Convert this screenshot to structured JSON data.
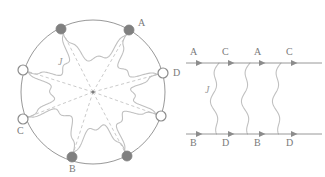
{
  "figure": {
    "background_color": "#ffffff",
    "stroke_color": "#8c8c8c",
    "wavy_color": "#c0c0c0",
    "dashed_color": "#bdbdbd",
    "filled_node_color": "#808080",
    "open_node_fill": "#ffffff",
    "label_color": "#7a7a7a"
  },
  "chart_data": {
    "type": "diagram",
    "title": "",
    "panels": [
      {
        "name": "circle-panel",
        "kind": "ring-diagram",
        "center": {
          "x": 93,
          "y": 92
        },
        "radius": 72,
        "node_count": 8,
        "center_point": true,
        "nodes": [
          {
            "id": "n0",
            "label": "A",
            "filled": true,
            "angle_deg": -60,
            "x": 129,
            "y": 30,
            "label_dx": 9,
            "label_dy": -4
          },
          {
            "id": "n1",
            "label": "D",
            "filled": false,
            "angle_deg": -15,
            "x": 163,
            "y": 73,
            "label_dx": 10,
            "label_dy": 3
          },
          {
            "id": "n2",
            "label": "",
            "filled": false,
            "angle_deg": 20,
            "x": 161,
            "y": 116,
            "label_dx": 0,
            "label_dy": 0
          },
          {
            "id": "n3",
            "label": "",
            "filled": true,
            "angle_deg": 62,
            "x": 127,
            "y": 156,
            "label_dx": 0,
            "label_dy": 0
          },
          {
            "id": "n4",
            "label": "B",
            "filled": true,
            "angle_deg": 108,
            "x": 72,
            "y": 157,
            "label_dx": -3,
            "label_dy": 15
          },
          {
            "id": "n5",
            "label": "C",
            "filled": false,
            "angle_deg": 160,
            "x": 23,
            "y": 119,
            "label_dx": -6,
            "label_dy": 15
          },
          {
            "id": "n6",
            "label": "",
            "filled": false,
            "angle_deg": 195,
            "x": 23,
            "y": 70,
            "label_dx": 0,
            "label_dy": 0
          },
          {
            "id": "n7",
            "label": "",
            "filled": true,
            "angle_deg": 240,
            "x": 61,
            "y": 29,
            "label_dx": 0,
            "label_dy": 0
          }
        ],
        "coupling_label": "J",
        "coupling_label_pos": {
          "x": 58,
          "y": 65
        },
        "radial_lines_dashed": true,
        "wavy_interactions": 8
      },
      {
        "name": "ladder-panel",
        "kind": "worldline-diagram",
        "top_line": {
          "y": 63,
          "x_start": 186,
          "x_end": 322,
          "labels": [
            "A",
            "C",
            "A",
            "C"
          ],
          "label_x": [
            190,
            222,
            254,
            286
          ],
          "label_y": 55,
          "arrow_x": [
            200,
            232,
            263,
            295
          ]
        },
        "bottom_line": {
          "y": 134,
          "x_start": 186,
          "x_end": 322,
          "labels": [
            "B",
            "D",
            "B",
            "D"
          ],
          "label_x": [
            190,
            222,
            254,
            286
          ],
          "label_y": 146,
          "arrow_x": [
            200,
            232,
            263,
            295
          ]
        },
        "rungs": [
          {
            "id": "r1",
            "x": 219,
            "label": "J",
            "label_x": 205,
            "label_y": 93
          },
          {
            "id": "r2",
            "x": 250,
            "label": "",
            "label_x": 0,
            "label_y": 0
          },
          {
            "id": "r3",
            "x": 281,
            "label": "",
            "label_x": 0,
            "label_y": 0
          }
        ]
      }
    ]
  }
}
